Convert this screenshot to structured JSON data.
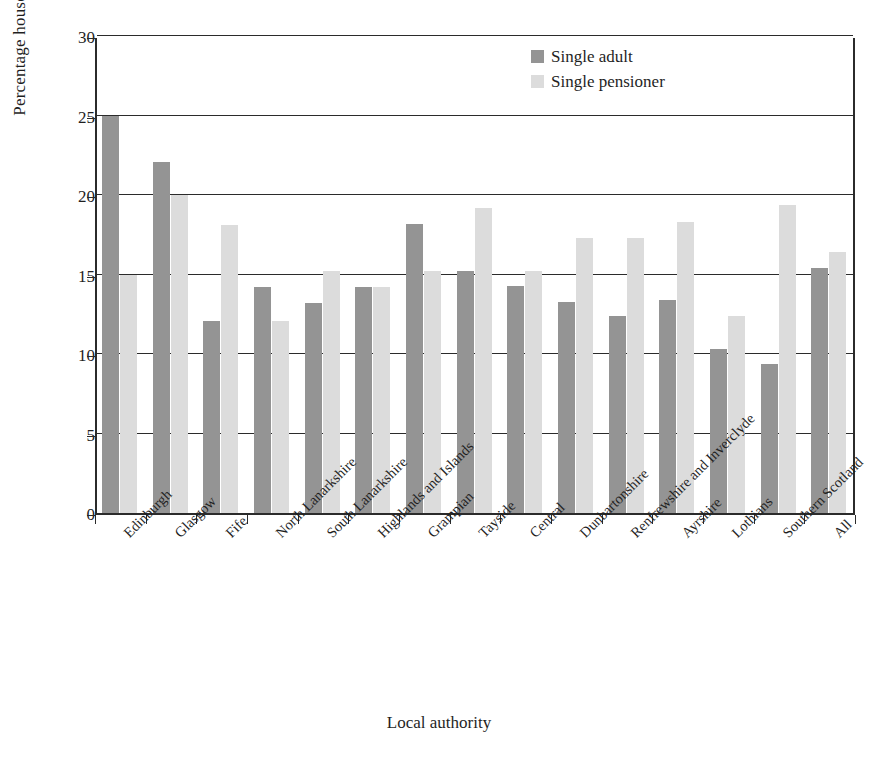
{
  "chart_data": {
    "type": "bar",
    "title": "",
    "subtitle": "",
    "xlabel": "Local authority",
    "ylabel": "Percentage households",
    "ylim": [
      0,
      30
    ],
    "yticks": [
      0,
      5,
      10,
      15,
      20,
      25,
      30
    ],
    "grid": true,
    "legend_position": "top-right",
    "categories": [
      "Edinburgh",
      "Glasgow",
      "Fife",
      "North Lanarkshire",
      "South Lanarkshire",
      "Highlands and Islands",
      "Grampian",
      "Tayside",
      "Central",
      "Dunbartonshire",
      "Renfrewshire and Inverclyde",
      "Ayrshire",
      "Lothians",
      "Southern Scotland",
      "All"
    ],
    "series": [
      {
        "name": "Single adult",
        "color": "#949494",
        "values": [
          25.0,
          22.1,
          12.1,
          14.2,
          13.2,
          14.2,
          18.2,
          15.2,
          14.3,
          13.3,
          12.4,
          13.4,
          10.3,
          9.4,
          15.4
        ]
      },
      {
        "name": "Single pensioner",
        "color": "#dcdcdc",
        "values": [
          15.0,
          20.0,
          18.1,
          12.1,
          15.2,
          14.2,
          15.2,
          19.2,
          15.2,
          17.3,
          17.3,
          18.3,
          12.4,
          19.4,
          16.4
        ]
      }
    ]
  },
  "axis": {
    "y_title": "Percentage households",
    "x_title": "Local authority",
    "y_tick_labels": [
      "0",
      "5",
      "10",
      "15",
      "20",
      "25",
      "30"
    ]
  },
  "legend": {
    "items": [
      {
        "label": "Single adult",
        "color": "#949494"
      },
      {
        "label": "Single pensioner",
        "color": "#dcdcdc"
      }
    ]
  },
  "colors": {
    "axis": "#2b2b2b",
    "grid": "#2b2b2b",
    "text": "#1f1f1f",
    "background": "#ffffff",
    "series_adult": "#949494",
    "series_pensioner": "#dcdcdc"
  }
}
